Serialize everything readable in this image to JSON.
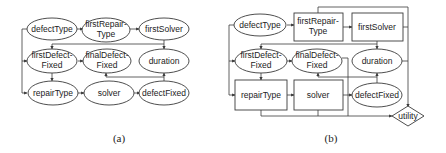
{
  "diagrams": [
    {
      "caption": "(a)",
      "nodes": {
        "defectType": {
          "label": "defectType",
          "shape": "ellipse"
        },
        "firstRepairType": {
          "label1": "firstRepair-",
          "label2": "Type",
          "shape": "ellipse"
        },
        "firstSolver": {
          "label": "firstSolver",
          "shape": "ellipse"
        },
        "firstDefectFixed": {
          "label1": "firstDefect-",
          "label2": "Fixed",
          "shape": "ellipse"
        },
        "finalDefectFixed": {
          "label1": "finalDefect-",
          "label2": "Fixed",
          "shape": "ellipse"
        },
        "duration": {
          "label": "duration",
          "shape": "ellipse"
        },
        "repairType": {
          "label": "repairType",
          "shape": "ellipse"
        },
        "solver": {
          "label": "solver",
          "shape": "ellipse"
        },
        "defectFixed": {
          "label": "defectFixed",
          "shape": "ellipse"
        }
      },
      "edges": [
        [
          "defectType",
          "firstRepairType"
        ],
        [
          "firstRepairType",
          "firstSolver"
        ],
        [
          "defectType",
          "firstDefectFixed"
        ],
        [
          "defectType",
          "repairType"
        ],
        [
          "firstSolver",
          "firstDefectFixed"
        ],
        [
          "firstSolver",
          "duration"
        ],
        [
          "firstDefectFixed",
          "finalDefectFixed"
        ],
        [
          "firstDefectFixed",
          "repairType"
        ],
        [
          "repairType",
          "solver"
        ],
        [
          "solver",
          "defectFixed"
        ],
        [
          "defectFixed",
          "finalDefectFixed"
        ],
        [
          "defectFixed",
          "duration"
        ]
      ]
    },
    {
      "caption": "(b)",
      "nodes": {
        "defectType": {
          "label": "defectType",
          "shape": "ellipse"
        },
        "firstRepairType": {
          "label1": "firstRepair-",
          "label2": "Type",
          "shape": "rectangle"
        },
        "firstSolver": {
          "label": "firstSolver",
          "shape": "rectangle"
        },
        "firstDefectFixed": {
          "label1": "firstDefect-",
          "label2": "Fixed",
          "shape": "ellipse"
        },
        "finalDefectFixed": {
          "label1": "finalDefect-",
          "label2": "Fixed",
          "shape": "ellipse"
        },
        "duration": {
          "label": "duration",
          "shape": "ellipse"
        },
        "repairType": {
          "label": "repairType",
          "shape": "rectangle"
        },
        "solver": {
          "label": "solver",
          "shape": "rectangle"
        },
        "defectFixed": {
          "label": "defectFixed",
          "shape": "ellipse"
        },
        "utility": {
          "label": "utility",
          "shape": "diamond"
        }
      },
      "edges": [
        [
          "defectType",
          "firstRepairType"
        ],
        [
          "firstRepairType",
          "firstSolver"
        ],
        [
          "defectType",
          "firstDefectFixed"
        ],
        [
          "defectType",
          "repairType"
        ],
        [
          "firstSolver",
          "firstDefectFixed"
        ],
        [
          "firstSolver",
          "duration"
        ],
        [
          "firstDefectFixed",
          "finalDefectFixed"
        ],
        [
          "firstDefectFixed",
          "repairType"
        ],
        [
          "repairType",
          "solver"
        ],
        [
          "solver",
          "defectFixed"
        ],
        [
          "defectFixed",
          "finalDefectFixed"
        ],
        [
          "defectFixed",
          "duration"
        ],
        [
          "firstRepairType",
          "utility"
        ],
        [
          "firstSolver",
          "utility"
        ],
        [
          "duration",
          "utility"
        ],
        [
          "finalDefectFixed",
          "utility"
        ],
        [
          "repairType",
          "utility"
        ],
        [
          "solver",
          "utility"
        ]
      ]
    }
  ]
}
